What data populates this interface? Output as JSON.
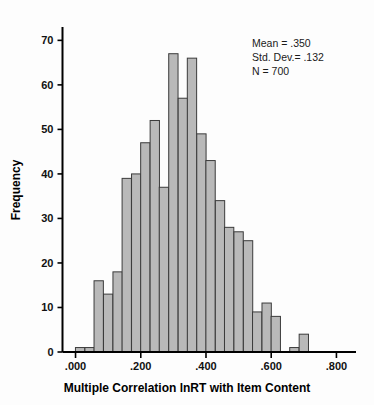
{
  "chart_data": {
    "type": "bar",
    "title": "",
    "subtitle": "",
    "xlabel": "Multiple Correlation lnRT with Item Content",
    "ylabel": "Frequency",
    "xlim": [
      -0.04,
      0.86
    ],
    "ylim": [
      0,
      73
    ],
    "grid": false,
    "legend": null,
    "bin_width": 0.02857,
    "x_ticks": [
      ".000",
      ".200",
      ".400",
      ".600",
      ".800"
    ],
    "x_tick_values": [
      0.0,
      0.2,
      0.4,
      0.6,
      0.8
    ],
    "y_ticks": [
      "0",
      "10",
      "20",
      "30",
      "40",
      "50",
      "60",
      "70"
    ],
    "y_tick_values": [
      0,
      10,
      20,
      30,
      40,
      50,
      60,
      70
    ],
    "categories": [
      "0.014",
      "0.043",
      "0.071",
      "0.100",
      "0.129",
      "0.157",
      "0.186",
      "0.214",
      "0.243",
      "0.271",
      "0.300",
      "0.329",
      "0.357",
      "0.386",
      "0.414",
      "0.443",
      "0.471",
      "0.500",
      "0.529",
      "0.557",
      "0.586",
      "0.614",
      "0.643",
      "0.671",
      "0.700",
      "0.729"
    ],
    "values": [
      1,
      1,
      16,
      13,
      18,
      39,
      40,
      47,
      52,
      37,
      67,
      57,
      66,
      49,
      43,
      34,
      28,
      27,
      25,
      9,
      11,
      8,
      0,
      1,
      4,
      0
    ],
    "bar_fill_color": "#b9b9b9",
    "bar_edge_color": "#3b3b3b",
    "curve_color": "#111111",
    "curve_type": "normal-distribution-overlay",
    "curve_peak_value": 60,
    "curve_peak_x": 0.355
  },
  "annotation": {
    "mean_line": "Mean = .350",
    "stddev_line": "Std. Dev.= .132",
    "n_line": "N = 700"
  },
  "axes": {
    "y_title": "Frequency",
    "x_title": "Multiple Correlation lnRT with Item Content"
  }
}
